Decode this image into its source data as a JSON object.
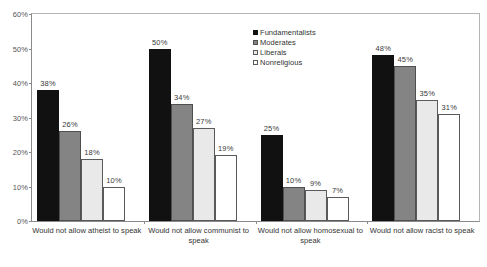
{
  "chart_data": {
    "type": "bar",
    "title": "",
    "subtitle": "",
    "xlabel": "",
    "ylabel": "",
    "ylim": [
      0,
      60
    ],
    "ytick_labels": [
      "0%",
      "10%",
      "20%",
      "30%",
      "40%",
      "50%",
      "60%"
    ],
    "ytick_values": [
      0,
      10,
      20,
      30,
      40,
      50,
      60
    ],
    "grid": false,
    "legend_position": "top-center-right",
    "value_suffix": "%",
    "categories": [
      "Would not allow atheist to speak",
      "Would not allow communist to speak",
      "Would not allow homosexual to speak",
      "Would not allow racist to speak"
    ],
    "series": [
      {
        "name": "Fundamentalists",
        "color": "#111111",
        "values": [
          38,
          50,
          25,
          48
        ],
        "labels": [
          "38%",
          "50%",
          "25%",
          "48%"
        ]
      },
      {
        "name": "Moderates",
        "color": "#848484",
        "values": [
          26,
          34,
          10,
          45
        ],
        "labels": [
          "26%",
          "34%",
          "10%",
          "45%"
        ]
      },
      {
        "name": "Liberals",
        "color": "#e9e9e9",
        "values": [
          18,
          27,
          9,
          35
        ],
        "labels": [
          "18%",
          "27%",
          "9%",
          "35%"
        ]
      },
      {
        "name": "Nonreligious",
        "color": "#ffffff",
        "values": [
          10,
          19,
          7,
          31
        ],
        "labels": [
          "10%",
          "19%",
          "7%",
          "31%"
        ]
      }
    ]
  }
}
